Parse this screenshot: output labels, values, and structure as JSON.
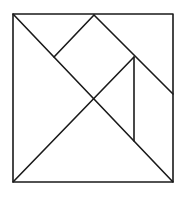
{
  "diagram": {
    "type": "tangram",
    "stroke_color": "#1a1a1a",
    "background": "#ffffff",
    "outer_square": {
      "x1": 13,
      "y1": 14,
      "x2": 173,
      "y2": 182
    },
    "segments": [
      {
        "name": "main-diagonal",
        "x1": 13,
        "y1": 14,
        "x2": 173,
        "y2": 182
      },
      {
        "name": "half-diagonal",
        "x1": 13,
        "y1": 182,
        "x2": 134,
        "y2": 57
      },
      {
        "name": "top-to-right-edge",
        "x1": 94,
        "y1": 15,
        "x2": 173,
        "y2": 94
      },
      {
        "name": "top-to-square-left",
        "x1": 94,
        "y1": 15,
        "x2": 54,
        "y2": 57
      },
      {
        "name": "parallelogram-vertical",
        "x1": 134,
        "y1": 57,
        "x2": 134,
        "y2": 141
      }
    ]
  }
}
